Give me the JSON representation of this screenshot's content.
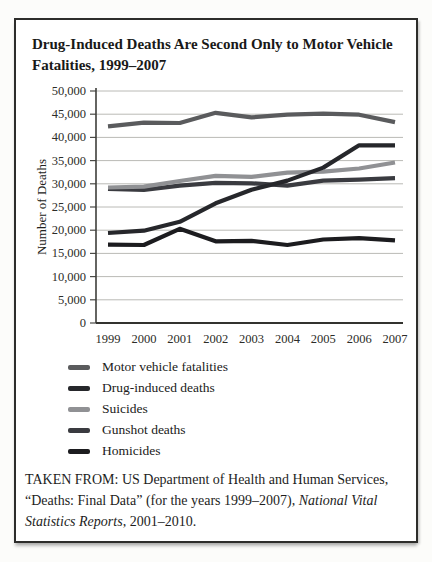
{
  "figure": {
    "title": "Drug-Induced Deaths Are Second Only to Motor Vehicle\nFatalities, 1999–2007",
    "source": {
      "prefix": "TAKEN FROM: US Department of Health and Human Services, “Deaths: Final Data” (for the years 1999–2007), ",
      "italic": "National Vital Statistics Reports",
      "suffix": ", 2001–2010."
    }
  },
  "chart_data": {
    "type": "line",
    "title": "Drug-Induced Deaths Are Second Only to Motor Vehicle Fatalities, 1999–2007",
    "xlabel": "",
    "ylabel": "Number of Deaths",
    "x": [
      "1999",
      "2000",
      "2001",
      "2002",
      "2003",
      "2004",
      "2005",
      "2006",
      "2007"
    ],
    "series": [
      {
        "name": "Motor vehicle fatalities",
        "color": "#5a5b5d",
        "values": [
          42400,
          43200,
          43100,
          45300,
          44300,
          44900,
          45100,
          44900,
          43300
        ]
      },
      {
        "name": "Drug-induced deaths",
        "color": "#26272b",
        "values": [
          19400,
          19900,
          21800,
          25800,
          28700,
          30700,
          33500,
          38300,
          38300
        ]
      },
      {
        "name": "Suicides",
        "color": "#909194",
        "values": [
          29200,
          29400,
          30600,
          31700,
          31500,
          32400,
          32600,
          33300,
          34600
        ]
      },
      {
        "name": "Gunshot deaths",
        "color": "#3a3b40",
        "values": [
          28900,
          28700,
          29600,
          30200,
          30100,
          29600,
          30700,
          30900,
          31200
        ]
      },
      {
        "name": "Homicides",
        "color": "#1c1c1f",
        "values": [
          16900,
          16800,
          20300,
          17600,
          17700,
          16800,
          18000,
          18300,
          17800
        ]
      }
    ],
    "ylim": [
      0,
      50000
    ],
    "y_tick_values": [
      0,
      5000,
      10000,
      15000,
      20000,
      25000,
      30000,
      35000,
      40000,
      45000,
      50000
    ],
    "y_tick_labels": [
      "0",
      "5,000",
      "10,000",
      "15,000",
      "20,000",
      "25,000",
      "30,000",
      "35,000",
      "40,000",
      "45,000",
      "50,000"
    ],
    "grid": true,
    "legend_position": "bottom-left"
  }
}
